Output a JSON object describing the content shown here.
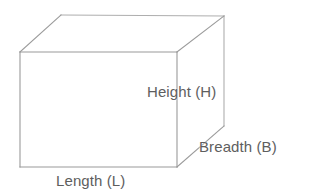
{
  "figure": {
    "name": "cuboid-dimensions-diagram",
    "shape": "cuboid",
    "background_color": "#ffffff",
    "line_color": "#9a9a9a",
    "hidden_line_color": "#aeaeae",
    "label_color": "#5e5e5e"
  },
  "labels": {
    "height": "Height (H)",
    "breadth": "Breadth (B)",
    "length": "Length (L)"
  },
  "geometry": {
    "front_face": {
      "top_left": [
        20,
        52
      ],
      "top_right": [
        177,
        52
      ],
      "bottom_right": [
        177,
        167
      ],
      "bottom_left": [
        20,
        167
      ]
    },
    "back_face": {
      "top_left": [
        61,
        15
      ],
      "top_right": [
        224,
        16
      ],
      "bottom_right": [
        224,
        126
      ]
    },
    "connectors": [
      [
        [
          20,
          52
        ],
        [
          61,
          15
        ]
      ],
      [
        [
          177,
          52
        ],
        [
          224,
          16
        ]
      ],
      [
        [
          177,
          167
        ],
        [
          224,
          126
        ]
      ]
    ]
  }
}
